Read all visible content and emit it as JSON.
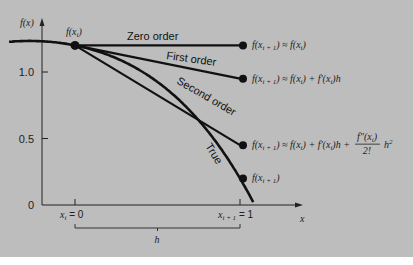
{
  "chart_data": {
    "type": "line",
    "title": "",
    "xlabel": "x",
    "ylabel": "f(x)",
    "xlim": [
      -0.2,
      1.3
    ],
    "ylim": [
      0,
      1.3
    ],
    "y_ticks": [
      "0",
      "0.5",
      "1.0"
    ],
    "y_tick_values": [
      0,
      0.5,
      1.0
    ],
    "x_tick_labels": [
      "x_i = 0",
      "x_{i+1} = 1"
    ],
    "x_tick_values": [
      0,
      1
    ],
    "brace_label": "h",
    "start_point_label": "f(x_i)",
    "true_function": "-0.1x^4 - 0.15x^3 - 0.5x^2 - 0.25x + 1.2",
    "series": [
      {
        "name": "Zero order",
        "x": [
          0,
          1
        ],
        "y": [
          1.2,
          1.2
        ],
        "end_label": "f(x_{i+1}) ≈ f(x_i)"
      },
      {
        "name": "First order",
        "x": [
          0,
          1
        ],
        "y": [
          1.2,
          0.95
        ],
        "end_label": "f(x_{i+1}) ≈ f(x_i) + f′(x_i)h"
      },
      {
        "name": "Second order",
        "x": [
          0,
          1
        ],
        "y": [
          1.2,
          0.45
        ],
        "end_label": "f(x_{i+1}) ≈ f(x_i) + f′(x_i)h + f″(x_i)/2! h²"
      },
      {
        "name": "True",
        "x": [
          -0.4,
          1.1
        ],
        "y": "true_function",
        "end_label": "f(x_{i+1})",
        "end_value": 0.2
      }
    ]
  }
}
